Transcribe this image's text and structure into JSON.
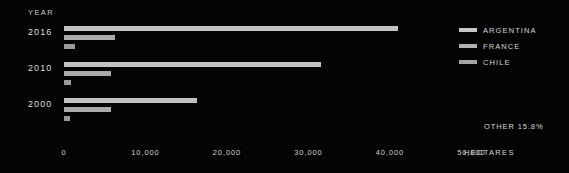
{
  "axis": {
    "year_header": "YEAR",
    "x_title": "HECTARES",
    "ticks": [
      "0",
      "10,000",
      "20,000",
      "30,000",
      "40,000",
      "50,000"
    ]
  },
  "legend": {
    "items": [
      {
        "label": "ARGENTINA",
        "swatch_class": "s-argentina",
        "color": "#c8c8c8",
        "icon": "legend-swatch-icon"
      },
      {
        "label": "FRANCE",
        "swatch_class": "s-france",
        "color": "#b0b0b0",
        "icon": "legend-swatch-icon"
      },
      {
        "label": "CHILE",
        "swatch_class": "s-chile",
        "color": "#a4a4a4",
        "icon": "legend-swatch-icon"
      }
    ]
  },
  "annotations": {
    "other_share": "OTHER 15.8%"
  },
  "colors": {
    "background": "#040404",
    "argentina": "#c2c2c2",
    "france": "#a9a9a9",
    "chile": "#9a9a9a",
    "text": "#d6d6d6"
  },
  "chart_data": {
    "type": "bar",
    "orientation": "horizontal",
    "title": "",
    "subtitle": "",
    "xlabel": "HECTARES",
    "ylabel": "YEAR",
    "xlim": [
      0,
      54000
    ],
    "xticks": [
      0,
      10000,
      20000,
      30000,
      40000,
      50000
    ],
    "xtick_labels": [
      "0",
      "10,000",
      "20,000",
      "30,000",
      "40,000",
      "50,000"
    ],
    "grid": false,
    "legend_position": "right",
    "categories": [
      "2016",
      "2010",
      "2000"
    ],
    "series": [
      {
        "name": "ARGENTINA",
        "color": "#c2c2c2",
        "values": [
          41000,
          31500,
          16300
        ]
      },
      {
        "name": "FRANCE",
        "color": "#a9a9a9",
        "values": [
          6300,
          5800,
          5800
        ]
      },
      {
        "name": "CHILE",
        "color": "#9a9a9a",
        "values": [
          1400,
          800,
          700
        ]
      }
    ],
    "annotations": [
      {
        "text": "OTHER 15.8%",
        "position": "bottom-right"
      }
    ]
  }
}
